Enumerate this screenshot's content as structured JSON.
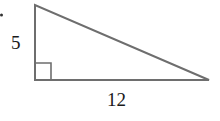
{
  "diagram": {
    "type": "right-triangle",
    "labels": {
      "vertical_leg": "5",
      "horizontal_leg": "12"
    },
    "colors": {
      "stroke": "#6e6e6e",
      "text": "#1a1a1a"
    },
    "right_angle_marker": true
  }
}
